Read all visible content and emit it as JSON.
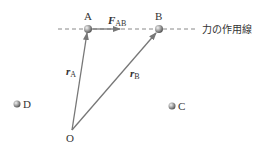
{
  "diagram": {
    "points": [
      {
        "id": "A",
        "label": "A",
        "x": 88,
        "y": 29
      },
      {
        "id": "B",
        "label": "B",
        "x": 159,
        "y": 29
      },
      {
        "id": "C",
        "label": "C",
        "x": 172,
        "y": 106
      },
      {
        "id": "D",
        "label": "D",
        "x": 17,
        "y": 104
      },
      {
        "id": "O",
        "label": "O",
        "x": 72,
        "y": 130
      }
    ],
    "line_of_action": {
      "label": "力の作用線",
      "y": 29,
      "x_start": 58,
      "x_end": 198,
      "style": "dashed"
    },
    "vectors": [
      {
        "name": "force",
        "symbol": "F",
        "subscript": "AB",
        "from": "A",
        "to_x": 121,
        "to_y": 29
      },
      {
        "name": "position-a",
        "symbol": "r",
        "subscript": "A",
        "from": "O",
        "to": "A"
      },
      {
        "name": "position-b",
        "symbol": "r",
        "subscript": "B",
        "from": "O",
        "to": "B"
      }
    ],
    "colors": {
      "line": "#777777",
      "dash": "#888888",
      "ball": "#999999",
      "text": "#333333"
    }
  }
}
